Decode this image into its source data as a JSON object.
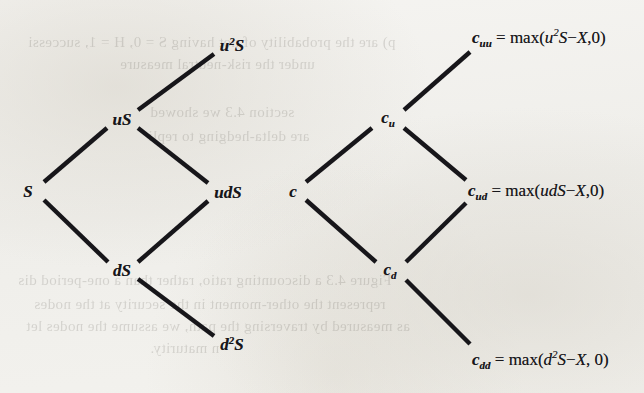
{
  "figure": {
    "kind": "binomial-lattice-pair"
  },
  "background_bleed": [
    {
      "text": "p) are the probability of not having S = 0, H = 1, successi",
      "x": 28,
      "y": 34
    },
    {
      "text": "under the risk-neutral measure",
      "x": 120,
      "y": 56
    },
    {
      "text": "section 4.3 we showed",
      "x": 150,
      "y": 104
    },
    {
      "text": "are delta-hedging to repli",
      "x": 148,
      "y": 128
    },
    {
      "text": "Figure 4.3 a discounting ratio, rather than a one-period dis",
      "x": 18,
      "y": 272
    },
    {
      "text": "represent the other-moment in the security at the nodes",
      "x": 34,
      "y": 296
    },
    {
      "text": "as measured by traversing the path, we assume the nodes let",
      "x": 26,
      "y": 318
    },
    {
      "text": "n maturity.",
      "x": 150,
      "y": 340
    }
  ],
  "asset_tree": {
    "name": "asset-price-tree",
    "nodes": [
      {
        "id": "S",
        "x": 28,
        "y": 191,
        "parts": [
          {
            "t": "S",
            "k": "base"
          }
        ]
      },
      {
        "id": "uS",
        "x": 122,
        "y": 119,
        "parts": [
          {
            "t": "uS",
            "k": "base"
          }
        ]
      },
      {
        "id": "dS",
        "x": 122,
        "y": 270,
        "parts": [
          {
            "t": "dS",
            "k": "base"
          }
        ]
      },
      {
        "id": "uuS",
        "x": 232,
        "y": 45,
        "parts": [
          {
            "t": "u",
            "k": "base"
          },
          {
            "t": "2",
            "k": "sup"
          },
          {
            "t": "S",
            "k": "base"
          }
        ]
      },
      {
        "id": "udS",
        "x": 228,
        "y": 192,
        "parts": [
          {
            "t": "udS",
            "k": "base"
          }
        ]
      },
      {
        "id": "ddS",
        "x": 232,
        "y": 344,
        "parts": [
          {
            "t": "d",
            "k": "base"
          },
          {
            "t": "2",
            "k": "sup"
          },
          {
            "t": "S",
            "k": "base"
          }
        ]
      }
    ],
    "edges": [
      {
        "from": "S",
        "to": "uS",
        "x1": 44,
        "y1": 182,
        "x2": 107,
        "y2": 128
      },
      {
        "from": "S",
        "to": "dS",
        "x1": 44,
        "y1": 200,
        "x2": 108,
        "y2": 262
      },
      {
        "from": "uS",
        "to": "uuS",
        "x1": 138,
        "y1": 110,
        "x2": 214,
        "y2": 54
      },
      {
        "from": "uS",
        "to": "udS",
        "x1": 138,
        "y1": 128,
        "x2": 208,
        "y2": 183
      },
      {
        "from": "dS",
        "to": "udS",
        "x1": 138,
        "y1": 262,
        "x2": 208,
        "y2": 201
      },
      {
        "from": "dS",
        "to": "ddS",
        "x1": 138,
        "y1": 279,
        "x2": 214,
        "y2": 336
      }
    ]
  },
  "option_tree": {
    "name": "option-value-tree",
    "nodes": [
      {
        "id": "c",
        "x": 293,
        "y": 191,
        "parts": [
          {
            "t": "c",
            "k": "base"
          }
        ]
      },
      {
        "id": "cu",
        "x": 388,
        "y": 119,
        "parts": [
          {
            "t": "c",
            "k": "base"
          },
          {
            "t": "u",
            "k": "sub"
          }
        ]
      },
      {
        "id": "cd",
        "x": 390,
        "y": 271,
        "parts": [
          {
            "t": "c",
            "k": "base"
          },
          {
            "t": "d",
            "k": "sub"
          }
        ]
      }
    ],
    "edges": [
      {
        "from": "c",
        "to": "cu",
        "x1": 306,
        "y1": 182,
        "x2": 372,
        "y2": 128
      },
      {
        "from": "c",
        "to": "cd",
        "x1": 306,
        "y1": 200,
        "x2": 376,
        "y2": 262
      },
      {
        "from": "cu",
        "to": "cuu",
        "x1": 404,
        "y1": 110,
        "x2": 470,
        "y2": 52
      },
      {
        "from": "cu",
        "to": "cud",
        "x1": 404,
        "y1": 128,
        "x2": 466,
        "y2": 180
      },
      {
        "from": "cd",
        "to": "cud",
        "x1": 406,
        "y1": 262,
        "x2": 466,
        "y2": 203
      },
      {
        "from": "cd",
        "to": "cdd",
        "x1": 406,
        "y1": 280,
        "x2": 470,
        "y2": 344
      }
    ],
    "payoffs": [
      {
        "id": "cuu",
        "x": 472,
        "y": 38,
        "parts": [
          {
            "t": "c",
            "k": "cvar"
          },
          {
            "t": "uu",
            "k": "sub"
          },
          {
            "t": " = ",
            "k": "op"
          },
          {
            "t": "max(",
            "k": "mx"
          },
          {
            "t": "u",
            "k": "it"
          },
          {
            "t": "2",
            "k": "sup"
          },
          {
            "t": "S",
            "k": "it"
          },
          {
            "t": "−",
            "k": "op"
          },
          {
            "t": "X",
            "k": "it"
          },
          {
            "t": ",0)",
            "k": "mx"
          }
        ]
      },
      {
        "id": "cud",
        "x": 468,
        "y": 192,
        "parts": [
          {
            "t": "c",
            "k": "cvar"
          },
          {
            "t": "ud",
            "k": "sub"
          },
          {
            "t": " = ",
            "k": "op"
          },
          {
            "t": "max(",
            "k": "mx"
          },
          {
            "t": "udS",
            "k": "it"
          },
          {
            "t": "−",
            "k": "op"
          },
          {
            "t": "X",
            "k": "it"
          },
          {
            "t": ",0)",
            "k": "mx"
          }
        ]
      },
      {
        "id": "cdd",
        "x": 472,
        "y": 360,
        "parts": [
          {
            "t": "c",
            "k": "cvar"
          },
          {
            "t": "dd",
            "k": "sub"
          },
          {
            "t": " = ",
            "k": "op"
          },
          {
            "t": "max(",
            "k": "mx"
          },
          {
            "t": "d",
            "k": "it"
          },
          {
            "t": "2",
            "k": "sup"
          },
          {
            "t": "S",
            "k": "it"
          },
          {
            "t": "−",
            "k": "op"
          },
          {
            "t": "X",
            "k": "it"
          },
          {
            "t": ", 0)",
            "k": "mx"
          }
        ]
      }
    ]
  },
  "style": {
    "ink": "#17161a",
    "paper": "#f2f1ee",
    "branch_width": 4.4
  }
}
